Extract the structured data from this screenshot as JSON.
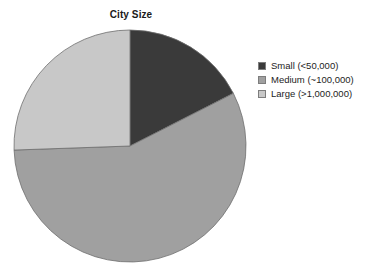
{
  "chart_data": {
    "type": "pie",
    "title": "City Size",
    "xlabel": "",
    "ylabel": "",
    "legend_position": "right",
    "grid": false,
    "start_angle_deg": 0,
    "direction": "clockwise",
    "categories": [
      "Small (<50,000)",
      "Medium (~100,000)",
      "Large (>1,000,000)"
    ],
    "values": [
      17.5,
      57.0,
      25.5
    ],
    "units": "percent",
    "slices": [
      {
        "label": "Small (<50,000)",
        "value": 17.5,
        "color": "#3a3a3a",
        "start_angle_deg": 0,
        "end_angle_deg": 63
      },
      {
        "label": "Medium (~100,000)",
        "value": 57.0,
        "color": "#a0a0a0",
        "start_angle_deg": 63,
        "end_angle_deg": 268
      },
      {
        "label": "Large (>1,000,000)",
        "value": 25.5,
        "color": "#c8c8c8",
        "start_angle_deg": 268,
        "end_angle_deg": 360
      }
    ]
  },
  "title": {
    "text": "City Size"
  },
  "legend": {
    "items": [
      {
        "label": "Small (<50,000)",
        "color": "#3a3a3a"
      },
      {
        "label": "Medium (~100,000)",
        "color": "#a0a0a0"
      },
      {
        "label": "Large (>1,000,000)",
        "color": "#c8c8c8"
      }
    ]
  },
  "geometry": {
    "center_x": 130,
    "center_y": 146,
    "radius": 116
  },
  "colors": {
    "background": "#ffffff",
    "text": "#1a1a1a",
    "slice_stroke": "#6e6e6e"
  }
}
